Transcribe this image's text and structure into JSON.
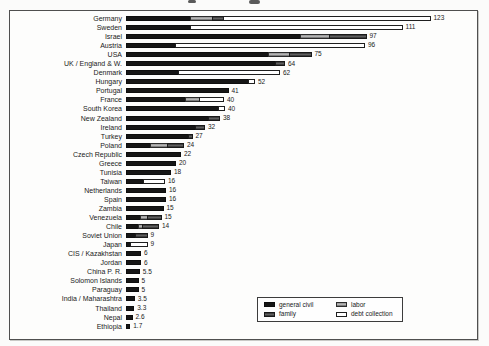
{
  "legend": {
    "items": [
      {
        "label": "general civil",
        "key": "civil"
      },
      {
        "label": "labor",
        "key": "labor"
      },
      {
        "label": "family",
        "key": "family"
      },
      {
        "label": "debt collection",
        "key": "debt"
      }
    ]
  },
  "chart_data": {
    "type": "bar",
    "orientation": "horizontal",
    "stacked": true,
    "title": "",
    "xlabel": "",
    "ylabel": "",
    "xlim": [
      0,
      140
    ],
    "grid": false,
    "legend_position": "bottom-right",
    "px_per_unit": 2.5,
    "categories": [
      "Germany",
      "Sweden",
      "Israel",
      "Austria",
      "USA",
      "UK / England & W.",
      "Denmark",
      "Hungary",
      "Portugal",
      "France",
      "South Korea",
      "New Zealand",
      "Ireland",
      "Turkey",
      "Poland",
      "Czech Republic",
      "Greece",
      "Tunisia",
      "Taiwan",
      "Netherlands",
      "Spain",
      "Zambia",
      "Venezuela",
      "Chile",
      "Soviet Union",
      "Japan",
      "CIS / Kazakhstan",
      "Jordan",
      "China P. R.",
      "Solomon Islands",
      "Paraguay",
      "India / Maharashtra",
      "Thailand",
      "Nepal",
      "Ethiopia"
    ],
    "totals": [
      123,
      111,
      97,
      96,
      75,
      64,
      62,
      52,
      41,
      40,
      40,
      38,
      32,
      27,
      24,
      22,
      20,
      18,
      16,
      16,
      16,
      15,
      15,
      14,
      9,
      9,
      6,
      6,
      5.5,
      5,
      5,
      3.5,
      3.3,
      2.6,
      1.7
    ],
    "value_labels": [
      "123",
      "111",
      "97",
      "96",
      "75",
      "64",
      "62",
      "52",
      "41",
      "40",
      "40",
      "38",
      "32",
      "27",
      "24",
      "22",
      "20",
      "18",
      "16",
      "16",
      "16",
      "15",
      "15",
      "14",
      "9",
      "9",
      "6",
      "6",
      "5.5",
      "5",
      "5",
      "3.5",
      "3.3",
      "2.6",
      "1.7"
    ],
    "series": [
      {
        "name": "general civil",
        "cls": "civil",
        "values": [
          26,
          26,
          70,
          20,
          57,
          60,
          21,
          49,
          41,
          24,
          37,
          33,
          28,
          25,
          10,
          22,
          20,
          18,
          7,
          16,
          16,
          15,
          6,
          5,
          4,
          2,
          6,
          6,
          5.5,
          5,
          5,
          3.5,
          3.3,
          2.6,
          1.7
        ]
      },
      {
        "name": "labor",
        "cls": "labor",
        "values": [
          9,
          0,
          12,
          0,
          9,
          0,
          0,
          0,
          0,
          6,
          0,
          0,
          0,
          0,
          7,
          0,
          0,
          0,
          0,
          0,
          0,
          0,
          3,
          2,
          0,
          0,
          0,
          0,
          0,
          0,
          0,
          0,
          0,
          0,
          0
        ]
      },
      {
        "name": "family",
        "cls": "family",
        "values": [
          5,
          0,
          15,
          0,
          9,
          4,
          0,
          0,
          0,
          0,
          0,
          5,
          4,
          2,
          7,
          0,
          0,
          0,
          0,
          0,
          0,
          0,
          6,
          7,
          5,
          0,
          0,
          0,
          0,
          0,
          0,
          0,
          0,
          0,
          0
        ]
      },
      {
        "name": "debt collection",
        "cls": "debt",
        "values": [
          83,
          85,
          0,
          76,
          0,
          0,
          41,
          3,
          0,
          10,
          3,
          0,
          0,
          0,
          0,
          0,
          0,
          0,
          9,
          0,
          0,
          0,
          0,
          0,
          0,
          7,
          0,
          0,
          0,
          0,
          0,
          0,
          0,
          0,
          0
        ]
      }
    ],
    "colors": {
      "general_civil": "#161616",
      "labor": "#a8a8a8",
      "family": "#444444",
      "debt_collection": "#ffffff",
      "frame_border": "#4f4f4f",
      "background": "#fdfdfc"
    }
  }
}
